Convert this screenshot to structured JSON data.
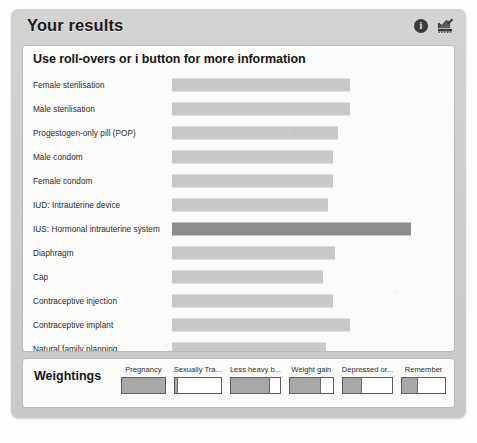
{
  "header": {
    "title": "Your results",
    "info_icon": "info-icon",
    "info_glyph": "i",
    "chart_icon": "chart-edit-icon"
  },
  "results": {
    "subtitle": "Use roll-overs or i button for more information"
  },
  "weightings": {
    "title": "Weightings",
    "sliders": [
      {
        "label": "Pregnancy",
        "value": 100
      },
      {
        "label": "Sexually Tra...",
        "value": 8
      },
      {
        "label": "Less heavy b...",
        "value": 80
      },
      {
        "label": "Weight gain",
        "value": 72
      },
      {
        "label": "Depressed or...",
        "value": 38
      },
      {
        "label": "Remember",
        "value": 38
      }
    ]
  },
  "chart_data": {
    "type": "bar",
    "title": "Your results",
    "subtitle": "Use roll-overs or i button for more information",
    "orientation": "horizontal",
    "xlabel": "",
    "ylabel": "",
    "grid": false,
    "legend": false,
    "axis_visible": false,
    "xlim": [
      0,
      100
    ],
    "bar_colors": {
      "normal": "#c9c9c9",
      "highlight": "#8d8d8d"
    },
    "highlighted_category": "IUS: Hormonal intrauterine system",
    "categories": [
      "Female sterilisation",
      "Male sterilisation",
      "Progestogen-only pill (POP)",
      "Male condom",
      "Female condom",
      "IUD: Intrauterine device",
      "IUS: Hormonal intrauterine system",
      "Diaphragm",
      "Cap",
      "Contraceptive injection",
      "Contraceptive implant",
      "Natural family planning"
    ],
    "values": [
      73,
      73,
      68,
      66,
      66,
      64,
      98,
      67,
      62,
      66,
      73,
      63
    ],
    "highlight_flags": [
      false,
      false,
      false,
      false,
      false,
      false,
      true,
      false,
      false,
      false,
      false,
      false
    ]
  }
}
